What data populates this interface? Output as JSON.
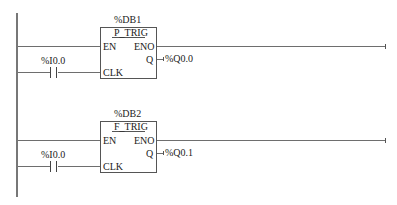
{
  "diagram": {
    "type": "ladder-logic",
    "networks": [
      {
        "instance": "%DB1",
        "block_type": "P_TRIG",
        "inputs": {
          "en": "EN",
          "clk": "CLK"
        },
        "outputs": {
          "eno": "ENO",
          "q": "Q"
        },
        "contact_address": "%I0.0",
        "output_address": "%Q0.0"
      },
      {
        "instance": "%DB2",
        "block_type": "F_TRIG",
        "inputs": {
          "en": "EN",
          "clk": "CLK"
        },
        "outputs": {
          "eno": "ENO",
          "q": "Q"
        },
        "contact_address": "%I0.0",
        "output_address": "%Q0.1"
      }
    ]
  }
}
